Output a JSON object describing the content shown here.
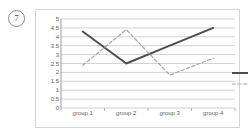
{
  "item_marker": "7",
  "colors": {
    "series1": "#4d4d4d",
    "series2": "#a6a6a6",
    "gridline": "#b3b3b3",
    "axis": "#808080",
    "frame": "#d4d4d4",
    "tick_text": "#5e5e5e"
  },
  "legend": {
    "position": "right",
    "entries": [
      {
        "label": "NO.1",
        "style": "solid"
      },
      {
        "label": "NO.2",
        "style": "dashed"
      }
    ]
  },
  "chart_data": {
    "type": "line",
    "title": "",
    "xlabel": "",
    "ylabel": "",
    "categories": [
      "group 1",
      "group 2",
      "group 3",
      "group 4"
    ],
    "ylim": [
      0,
      5
    ],
    "yticks": [
      "0",
      "0.5",
      "1",
      "1.5",
      "2",
      "2.5",
      "3",
      "3.5",
      "4",
      "4.5",
      "5"
    ],
    "ytick_values": [
      0,
      0.5,
      1,
      1.5,
      2,
      2.5,
      3,
      3.5,
      4,
      4.5,
      5
    ],
    "grid": true,
    "grid_axis": "y",
    "legend_position": "right",
    "series": [
      {
        "name": "NO.1",
        "style": "solid",
        "values": [
          4.3,
          2.5,
          3.5,
          4.5
        ]
      },
      {
        "name": "NO.2",
        "style": "dashed",
        "values": [
          2.4,
          4.4,
          1.85,
          2.8
        ]
      }
    ]
  }
}
